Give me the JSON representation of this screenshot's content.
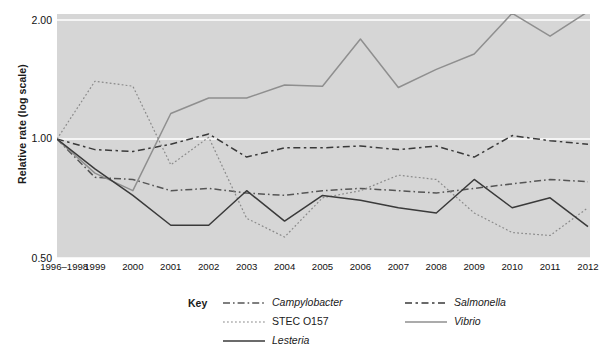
{
  "chart_data": {
    "type": "line",
    "title": "",
    "xlabel": "",
    "ylabel": "Relative rate (log scale)",
    "scale": "log",
    "ylim": [
      0.5,
      2.1
    ],
    "yticks": [
      "0.50",
      "1.00",
      "2.00"
    ],
    "ytick_values": [
      0.5,
      1.0,
      2.0
    ],
    "grid": true,
    "grid_axis": "y",
    "legend_position": "bottom",
    "legend_title": "Key",
    "plot_background": "#d6d6d6",
    "categories": [
      "1996–1998",
      "1999",
      "2000",
      "2001",
      "2002",
      "2003",
      "2004",
      "2005",
      "2006",
      "2007",
      "2008",
      "2009",
      "2010",
      "2011",
      "2012"
    ],
    "series": [
      {
        "name": "Campylobacter",
        "style": "dash-dot",
        "color": "#555555",
        "values": [
          1.0,
          0.8,
          0.79,
          0.74,
          0.75,
          0.73,
          0.72,
          0.74,
          0.75,
          0.74,
          0.73,
          0.75,
          0.77,
          0.79,
          0.78
        ]
      },
      {
        "name": "Salmonella",
        "style": "dashed",
        "color": "#3a3a3a",
        "values": [
          1.0,
          0.94,
          0.93,
          0.97,
          1.03,
          0.9,
          0.95,
          0.95,
          0.96,
          0.94,
          0.96,
          0.9,
          1.02,
          0.99,
          0.97
        ]
      },
      {
        "name": "STEC O157",
        "style": "dotted",
        "color": "#8a8a8a",
        "values": [
          1.0,
          1.4,
          1.36,
          0.86,
          1.01,
          0.63,
          0.565,
          0.71,
          0.74,
          0.81,
          0.79,
          0.65,
          0.58,
          0.57,
          0.67
        ]
      },
      {
        "name": "Vibrio",
        "style": "solid",
        "color": "#8f8f8f",
        "values": [
          1.0,
          0.82,
          0.74,
          1.16,
          1.27,
          1.27,
          1.37,
          1.36,
          1.79,
          1.35,
          1.5,
          1.64,
          2.08,
          1.82,
          2.1
        ]
      },
      {
        "name": "Lesteria",
        "style": "solid",
        "color": "#3a3a3a",
        "values": [
          1.0,
          0.84,
          0.72,
          0.605,
          0.605,
          0.74,
          0.62,
          0.72,
          0.7,
          0.67,
          0.65,
          0.79,
          0.67,
          0.71,
          0.6
        ]
      }
    ]
  }
}
